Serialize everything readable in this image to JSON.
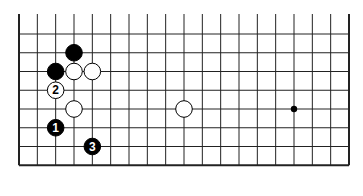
{
  "diagram": {
    "type": "go-board-fragment",
    "columns": 19,
    "rows": 9,
    "edges": {
      "left": true,
      "right": true,
      "bottom": true,
      "top": false
    },
    "stones": [
      {
        "color": "black",
        "col": 3,
        "row": 2,
        "label": ""
      },
      {
        "color": "black",
        "col": 2,
        "row": 3,
        "label": ""
      },
      {
        "color": "white",
        "col": 3,
        "row": 3,
        "label": ""
      },
      {
        "color": "white",
        "col": 4,
        "row": 3,
        "label": ""
      },
      {
        "color": "white",
        "col": 2,
        "row": 4,
        "label": "2"
      },
      {
        "color": "white",
        "col": 3,
        "row": 5,
        "label": ""
      },
      {
        "color": "white",
        "col": 9,
        "row": 5,
        "label": ""
      },
      {
        "color": "black",
        "col": 2,
        "row": 6,
        "label": "1"
      },
      {
        "color": "black",
        "col": 4,
        "row": 7,
        "label": "3"
      }
    ],
    "hoshi": [
      {
        "col": 15,
        "row": 5
      }
    ]
  }
}
